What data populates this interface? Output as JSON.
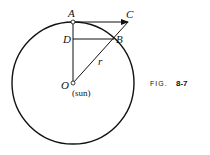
{
  "figure": {
    "caption_prefix": "FIG.",
    "caption_number": "8-7"
  },
  "labels": {
    "A": "A",
    "B": "B",
    "C": "C",
    "D": "D",
    "O": "O",
    "r": "r",
    "sun": "(sun)"
  },
  "colors": {
    "stroke": "#111111",
    "background": "#ffffff"
  }
}
